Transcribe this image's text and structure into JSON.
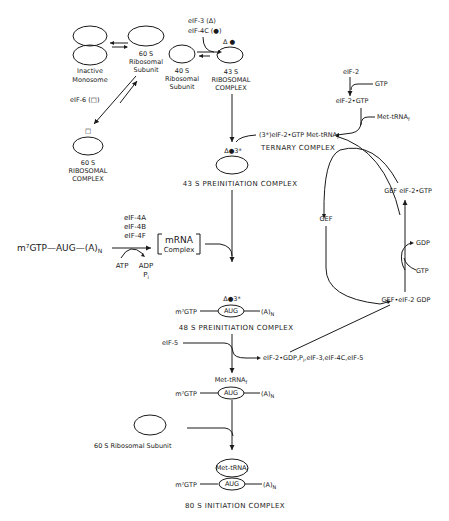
{
  "diagram": {
    "type": "biochemical-pathway",
    "nodes": {
      "inactive_monosome": {
        "line1": "Inactive",
        "line2": "Monosome"
      },
      "ribo_60s": {
        "line1": "60 S",
        "line2": "Ribosomal",
        "line3": "Subunit"
      },
      "ribo_40s": {
        "line1": "40 S",
        "line2": "Ribosomal",
        "line3": "Subunit"
      },
      "complex_43s": {
        "marks": "Δ ●",
        "line1": "43 S",
        "line2": "RIBOSOMAL",
        "line3": "COMPLEX"
      },
      "complex_60s": {
        "marks": "□",
        "line1": "60 S",
        "line2": "RIBOSOMAL",
        "line3": "COMPLEX"
      },
      "preinit_43s": {
        "marks": "Δ●3*",
        "label": "43 S PREINITIATION COMPLEX"
      },
      "ternary": {
        "line1": "(3*)eIF-2•GTP Met-tRNA",
        "sub": "f",
        "line2": "TERNARY COMPLEX"
      },
      "eif2": {
        "label": "eIF-2"
      },
      "gtp_in": {
        "label": "GTP"
      },
      "eif2_gtp": {
        "label": "eIF-2•GTP"
      },
      "met_trna": {
        "label": "Met-tRNA",
        "sub": "f"
      },
      "gef_eif2_gtp": {
        "label": "GEF eIF-2•GTP"
      },
      "gef": {
        "label": "GEF"
      },
      "gdp_out": {
        "label": "GDP"
      },
      "gtp_in2": {
        "label": "GTP"
      },
      "gef_eif2_gdp": {
        "label": "GEF•eIF-2 GDP"
      },
      "mrna": {
        "label": "m⁷GTP—AUG—(A)",
        "sub": "N"
      },
      "factors": {
        "f1": "eIF-4A",
        "f2": "eIF-4B",
        "f3": "eIF-4F"
      },
      "atp": {
        "label": "ATP"
      },
      "adp": {
        "label": "ADP"
      },
      "pi": {
        "label": "P",
        "sub": "i"
      },
      "mrna_complex": {
        "line1": "mRNA",
        "line2": "Complex"
      },
      "preinit_48s": {
        "marks": "Δ●3*",
        "cap": "m⁷GTP",
        "codon": "AUG",
        "tail": "(A)",
        "tail_sub": "N",
        "label": "48 S PREINITIATION COMPLEX"
      },
      "eif5": {
        "label": "eIF-5"
      },
      "released": {
        "label": "eIF-2•GDP,P",
        "sub": "i",
        "rest": ",eIF-3,eIF-4C,eIF-5"
      },
      "intermediate": {
        "trna": "Met-tRNA",
        "trna_sub": "f",
        "cap": "m⁷GTP",
        "codon": "AUG",
        "tail": "(A)",
        "tail_sub": "N"
      },
      "ribo_60s_free": {
        "label": "60 S Ribosomal Subunit"
      },
      "init_80s": {
        "trna": "Met-tRNA",
        "trna_sub": "f",
        "cap": "m⁷GTP",
        "codon": "AUG",
        "tail": "(A)",
        "tail_sub": "N",
        "label": "80 S INITIATION COMPLEX"
      }
    },
    "factors": {
      "eif3": "eIF-3  (Δ)",
      "eif4c": "eIF-4C (●)",
      "eif6": "eIF-6 (□)"
    }
  }
}
